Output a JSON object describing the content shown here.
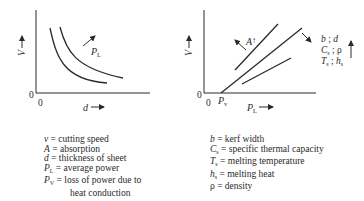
{
  "left_graph": {
    "y_axis_label": "V",
    "x_axis_label": "d",
    "origin_y_label": "0",
    "origin_x_label": "0",
    "curve_annotation": {
      "symbol": "P",
      "subscript": "L"
    },
    "description": "V decreases hyperbolically with d; higher P_L shifts curve outward"
  },
  "right_graph": {
    "y_axis_label": "V",
    "x_axis_label": {
      "symbol": "P",
      "subscript": "L"
    },
    "origin_y_label": "0",
    "origin_x_label": "0",
    "x_intercept_label": {
      "symbol": "P",
      "subscript": "v"
    },
    "absorption_annotation": {
      "symbol": "A",
      "arrow": "↑"
    },
    "parameter_annotation": {
      "lines": [
        {
          "a": "b",
          "a_sub": "",
          "sep": " ; ",
          "b": "d",
          "b_sub": ""
        },
        {
          "a": "C",
          "a_sub": "s",
          "sep": " ; ",
          "b": "ρ",
          "b_sub": ""
        },
        {
          "a": "T",
          "a_sub": "s",
          "sep": " ; ",
          "b": "h",
          "b_sub": "s"
        }
      ],
      "arrow": "↑"
    },
    "description": "V increases linearly with P_L starting at P_v"
  },
  "legend_left": [
    {
      "symbol": "v",
      "sub": "",
      "text": " = cutting speed"
    },
    {
      "symbol": "A",
      "sub": "",
      "text": " = absorption"
    },
    {
      "symbol": "d",
      "sub": "",
      "text": " = thickness of sheet"
    },
    {
      "symbol": "P",
      "sub": "L",
      "text": " = average power"
    },
    {
      "symbol": "P",
      "sub": "V",
      "text": " = loss of power due to",
      "continuation": "heat conduction"
    }
  ],
  "legend_right": [
    {
      "symbol": "b",
      "sub": "",
      "text": " = kerf width"
    },
    {
      "symbol": "C",
      "sub": "s",
      "text": " = specific thermal capacity"
    },
    {
      "symbol": "T",
      "sub": "s",
      "text": " = melting temperature"
    },
    {
      "symbol": "h",
      "sub": "s",
      "text": " = melting heat"
    },
    {
      "symbol": "ρ",
      "sub": "",
      "text": " = density"
    }
  ]
}
